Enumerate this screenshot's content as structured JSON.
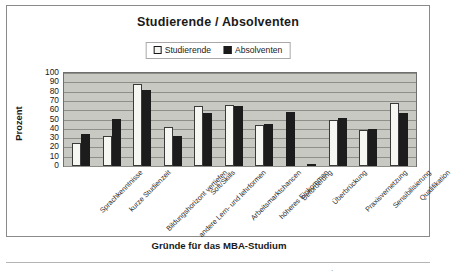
{
  "chart_data": {
    "type": "bar",
    "title": "Studierende / Absolventen",
    "xlabel": "Gründe für das MBA-Studium",
    "ylabel": "Prozent",
    "ylim": [
      0,
      100
    ],
    "ytick_step": 10,
    "yticks": [
      "100",
      "90",
      "80",
      "70",
      "60",
      "50",
      "40",
      "30",
      "20",
      "10",
      "0"
    ],
    "grid": true,
    "legend_position": "top-center",
    "categories": [
      "Sprachkenntnisse",
      "kurze Studienzeit",
      "Bildungshorizont vertiefen",
      "andere Lern- und lehrformen",
      "Soft/Skills",
      "Arbeitsmarktchancen",
      "höheres Einkommen",
      "Beförderung",
      "Überbrückung",
      "Praxisvernetzung",
      "Sensibilisierung",
      "Qualifikation"
    ],
    "series": [
      {
        "name": "Studierende",
        "color": "#f6f6f2",
        "values": [
          25,
          32,
          88,
          42,
          64,
          66,
          44,
          0,
          0,
          49,
          39,
          68
        ]
      },
      {
        "name": "Absolventen",
        "color": "#1c1c1c",
        "values": [
          34,
          51,
          82,
          32,
          57,
          65,
          45,
          58,
          2,
          52,
          40,
          57
        ]
      }
    ]
  },
  "legend": {
    "items": [
      {
        "label": "Studierende"
      },
      {
        "label": "Absolventen"
      }
    ]
  },
  "footer": {
    "mark": "."
  }
}
